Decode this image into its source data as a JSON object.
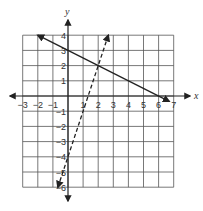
{
  "chart_data": {
    "type": "line",
    "title": "",
    "xlabel": "x",
    "ylabel": "y",
    "xlim": [
      -3,
      7
    ],
    "ylim": [
      -6,
      4
    ],
    "grid": true,
    "x_ticks": [
      -3,
      -2,
      -1,
      1,
      2,
      3,
      4,
      5,
      6,
      7
    ],
    "y_ticks": [
      4,
      3,
      2,
      1,
      -1,
      -2,
      -3,
      -4,
      -5,
      -6
    ],
    "series": [
      {
        "name": "solid line",
        "style": "solid",
        "equation": "y = -x/2 + 3",
        "points": [
          [
            -2,
            4
          ],
          [
            0,
            3
          ],
          [
            2,
            2
          ],
          [
            4,
            1
          ],
          [
            6,
            0
          ],
          [
            6.7,
            -0.35
          ]
        ],
        "arrows": "both"
      },
      {
        "name": "dashed line",
        "style": "dashed",
        "equation": "y = 3x - 4",
        "points": [
          [
            -0.67,
            -6
          ],
          [
            0,
            -4
          ],
          [
            1,
            -1
          ],
          [
            2,
            2
          ],
          [
            2.67,
            4
          ]
        ],
        "arrows": "both"
      }
    ],
    "intersection": [
      2,
      2
    ]
  },
  "colors": {
    "grid": "#555555",
    "axis": "#222222",
    "line": "#222222"
  }
}
